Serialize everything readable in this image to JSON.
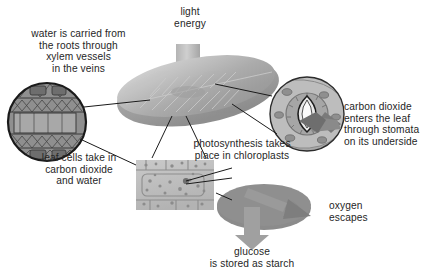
{
  "diagram": {
    "type": "biology-process-diagram",
    "background_color": "#ffffff",
    "text_color": "#262626",
    "leaf_color": "#9a9a9a",
    "arrow_color": "#8d8d8d",
    "line_color": "#1a1a1a"
  },
  "labels": {
    "light_energy": "light\nenergy",
    "water_xylem": "water is carried from\nthe roots through\nxylem vessels\nin the veins",
    "leaf_cells": "leaf cells take in\ncarbon dioxide\nand water",
    "photosynthesis": "photosynthesis takes\nplace in chloroplasts",
    "carbon_dioxide": "carbon dioxide\nenters the leaf\nthrough stomata\non its underside",
    "oxygen": "oxygen\nescapes",
    "glucose": "glucose\nis stored as starch"
  },
  "figures": {
    "leaf": "leaf-ellipse-with-veins",
    "xylem_inset": "xylem-vessel-cross-section-circle",
    "stomata_inset": "stomata-guard-cell-circle",
    "cell_inset": "leaf-cell-rectangle-with-chloroplasts",
    "chloroplast_disc": "chloroplast-disc"
  },
  "arrows": {
    "light_energy": "down-arrow-into-leaf",
    "carbon_dioxide": "arrow-into-stomata",
    "oxygen": "arrow-out-of-chloroplast",
    "glucose": "down-arrow-from-chloroplast"
  }
}
